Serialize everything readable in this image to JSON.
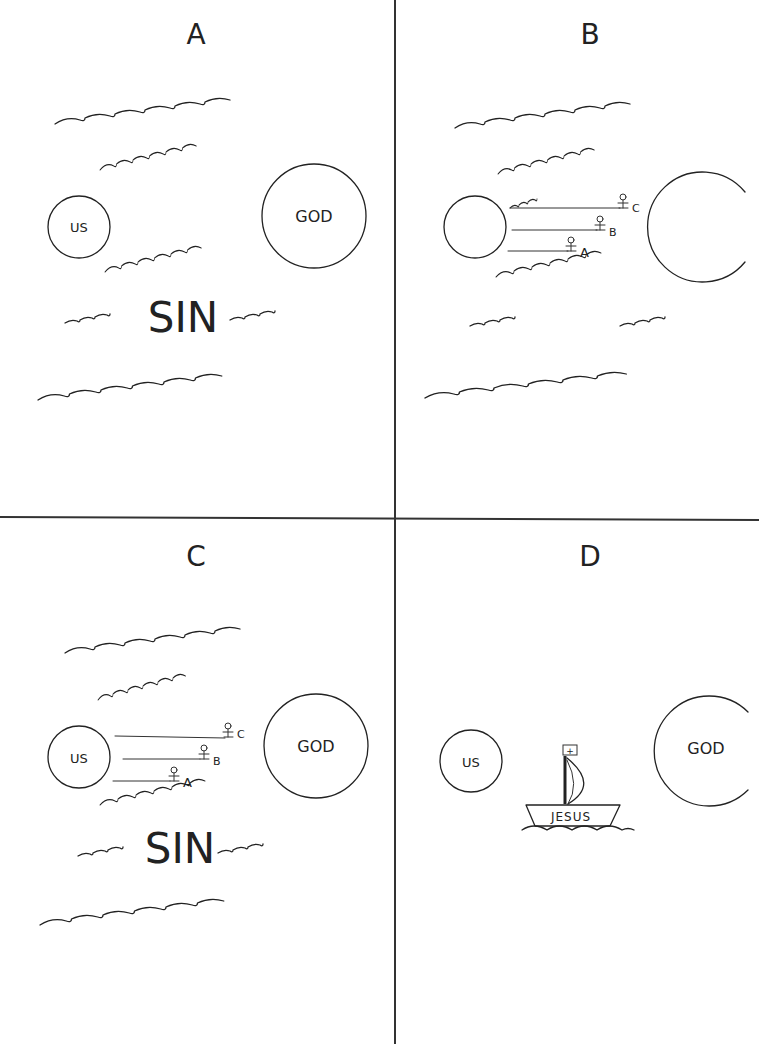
{
  "panels": {
    "A": {
      "title": "A",
      "us_label": "US",
      "god_label": "GOD",
      "sin_label": "SIN"
    },
    "B": {
      "title": "B",
      "swimmers": [
        "A",
        "B",
        "C"
      ]
    },
    "C": {
      "title": "C",
      "us_label": "US",
      "god_label": "GOD",
      "sin_label": "SIN",
      "swimmers": [
        "A",
        "B",
        "C"
      ]
    },
    "D": {
      "title": "D",
      "us_label": "US",
      "god_label": "GOD",
      "boat_label": "JESUS",
      "flag_symbol": "+"
    }
  }
}
